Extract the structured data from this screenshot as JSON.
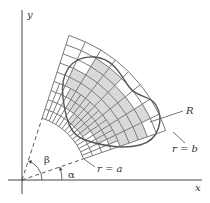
{
  "figure": {
    "origin": [
      22,
      180
    ],
    "inner_radius_px": 65,
    "outer_radius_px": 152,
    "alpha_deg": 19,
    "beta_deg": 72,
    "rings": 9,
    "outer_sectors": 8,
    "inner_sectors": 16,
    "inner_subdivided_rings": 4,
    "colors": {
      "axis": "#444444",
      "grid": "#7a7a7a",
      "boundary": "#555555",
      "shade": "#d9d9d9",
      "dashed": "#444444"
    }
  },
  "labels": {
    "x_axis": "x",
    "y_axis": "y",
    "region": "R",
    "inner_arc": "r = a",
    "outer_arc": "r = b",
    "alpha": "α",
    "beta": "β"
  }
}
